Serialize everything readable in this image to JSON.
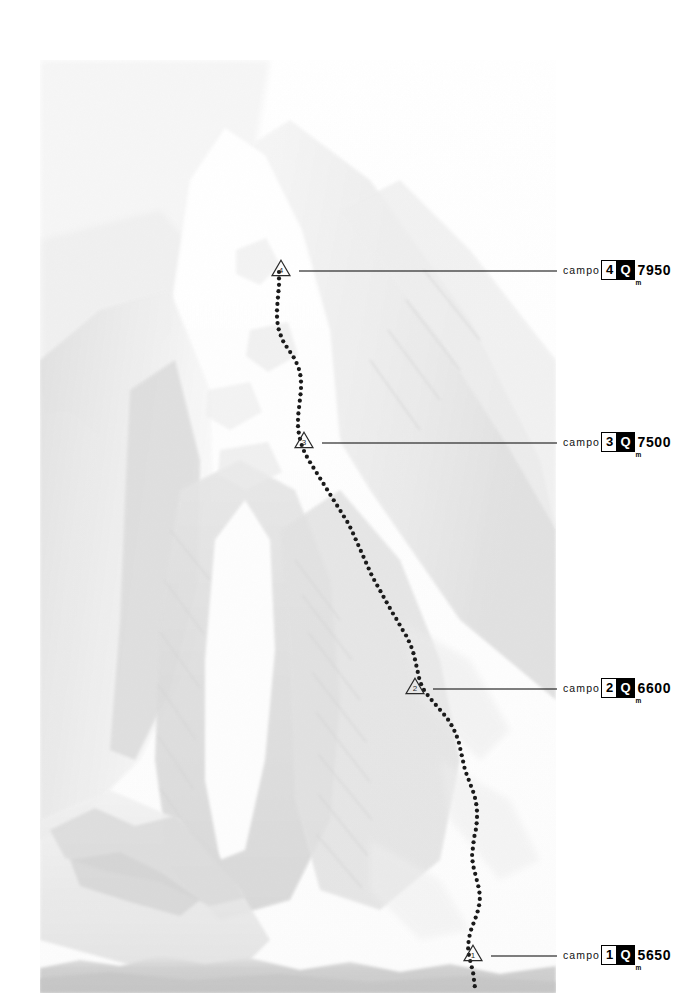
{
  "document": {
    "type": "mountaineering-route-topo",
    "description": "Faded black-and-white photograph of a snow-covered mountain face with a dotted climbing route and numbered camp callouts",
    "background_color": "#ffffff"
  },
  "photo": {
    "alt": "High-key faded photograph of a steep snow and rock mountain face",
    "left": 40,
    "top": 60,
    "width": 516,
    "height": 933
  },
  "route": {
    "name": "climbing-route",
    "style": "dotted",
    "dot_color": "#1a1a1a",
    "dot_radius": 2.1,
    "dot_spacing": 6.4,
    "points": [
      [
        279,
        272
      ],
      [
        279,
        285
      ],
      [
        278,
        297
      ],
      [
        277,
        309
      ],
      [
        277,
        320
      ],
      [
        279,
        331
      ],
      [
        283,
        341
      ],
      [
        288,
        349
      ],
      [
        293,
        356
      ],
      [
        297,
        364
      ],
      [
        300,
        372
      ],
      [
        301,
        381
      ],
      [
        301,
        390
      ],
      [
        300,
        399
      ],
      [
        299,
        408
      ],
      [
        298,
        417
      ],
      [
        298,
        426
      ],
      [
        299,
        435
      ],
      [
        301,
        443
      ],
      [
        304,
        451
      ],
      [
        308,
        459
      ],
      [
        313,
        467
      ],
      [
        318,
        475
      ],
      [
        323,
        483
      ],
      [
        328,
        491
      ],
      [
        333,
        499
      ],
      [
        338,
        507
      ],
      [
        343,
        515
      ],
      [
        348,
        523
      ],
      [
        352,
        531
      ],
      [
        356,
        540
      ],
      [
        360,
        549
      ],
      [
        364,
        558
      ],
      [
        368,
        567
      ],
      [
        372,
        576
      ],
      [
        377,
        585
      ],
      [
        382,
        594
      ],
      [
        387,
        603
      ],
      [
        392,
        612
      ],
      [
        397,
        620
      ],
      [
        402,
        629
      ],
      [
        407,
        637
      ],
      [
        411,
        646
      ],
      [
        414,
        655
      ],
      [
        416,
        664
      ],
      [
        418,
        673
      ],
      [
        420,
        682
      ],
      [
        424,
        690
      ],
      [
        429,
        697
      ],
      [
        435,
        704
      ],
      [
        441,
        711
      ],
      [
        447,
        718
      ],
      [
        452,
        726
      ],
      [
        456,
        734
      ],
      [
        459,
        743
      ],
      [
        461,
        752
      ],
      [
        463,
        761
      ],
      [
        465,
        770
      ],
      [
        468,
        778
      ],
      [
        471,
        786
      ],
      [
        474,
        794
      ],
      [
        476,
        802
      ],
      [
        477,
        811
      ],
      [
        477,
        820
      ],
      [
        476,
        829
      ],
      [
        474,
        838
      ],
      [
        473,
        847
      ],
      [
        472,
        856
      ],
      [
        473,
        865
      ],
      [
        475,
        873
      ],
      [
        477,
        881
      ],
      [
        479,
        889
      ],
      [
        480,
        897
      ],
      [
        479,
        906
      ],
      [
        477,
        914
      ],
      [
        474,
        922
      ],
      [
        471,
        930
      ],
      [
        469,
        938
      ],
      [
        468,
        947
      ],
      [
        469,
        956
      ],
      [
        471,
        964
      ],
      [
        473,
        972
      ],
      [
        474,
        980
      ],
      [
        475,
        988
      ]
    ]
  },
  "camps": [
    {
      "id": "camp-4",
      "number": "4",
      "marker": {
        "x": 270,
        "y": 258
      },
      "leader": {
        "x1": 299,
        "y1": 271,
        "x2": 557,
        "y2": 271
      },
      "label": {
        "campo_word": "campo",
        "number": "4",
        "q_symbol": "Q",
        "altitude": "7950",
        "unit": "m",
        "left": 563,
        "top": 260
      }
    },
    {
      "id": "camp-3",
      "number": "3",
      "marker": {
        "x": 293,
        "y": 430
      },
      "leader": {
        "x1": 322,
        "y1": 443,
        "x2": 557,
        "y2": 443
      },
      "label": {
        "campo_word": "campo",
        "number": "3",
        "q_symbol": "Q",
        "altitude": "7500",
        "unit": "m",
        "left": 563,
        "top": 432
      }
    },
    {
      "id": "camp-2",
      "number": "2",
      "marker": {
        "x": 404,
        "y": 676
      },
      "leader": {
        "x1": 433,
        "y1": 689,
        "x2": 557,
        "y2": 689
      },
      "label": {
        "campo_word": "campo",
        "number": "2",
        "q_symbol": "Q",
        "altitude": "6600",
        "unit": "m",
        "left": 563,
        "top": 678
      }
    },
    {
      "id": "camp-1",
      "number": "1",
      "marker": {
        "x": 462,
        "y": 943
      },
      "leader": {
        "x1": 491,
        "y1": 956,
        "x2": 557,
        "y2": 956
      },
      "label": {
        "campo_word": "campo",
        "number": "1",
        "q_symbol": "Q",
        "altitude": "5650",
        "unit": "m",
        "left": 563,
        "top": 945
      }
    }
  ],
  "colors": {
    "ink": "#000000",
    "route": "#1a1a1a",
    "paper": "#ffffff",
    "photo_light": "#fbfbfb",
    "photo_mid": "#e8e8e8",
    "photo_shadow": "#d2d2d2"
  }
}
